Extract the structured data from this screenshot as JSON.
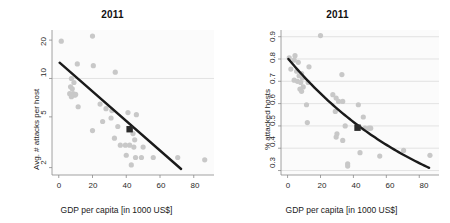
{
  "figure": {
    "width": 450,
    "height": 223,
    "background": "#ffffff",
    "point_color": "#c8c8c8",
    "fit_line_color": "#1a1a1a",
    "highlight_marker_color": "#2b2b2b",
    "grid_color": "#d9d9d9",
    "axis_color": "#8a8a8a"
  },
  "chart_data": [
    {
      "id": "left-panel",
      "type": "scatter",
      "title": "2011",
      "xlabel": "GDP per capita [in 1000 US$]",
      "ylabel": "Avg. # attacks per host",
      "xlim": [
        -4,
        92
      ],
      "ylim": [
        1.75,
        24
      ],
      "yscale": "log",
      "xticks": [
        0,
        20,
        40,
        60,
        80
      ],
      "xticklabels": [
        "0",
        "20",
        "40",
        "60",
        "80"
      ],
      "yticks": [
        2,
        5,
        10,
        20
      ],
      "yticklabels": [
        "2",
        "5",
        "10",
        "20"
      ],
      "grid": "horizontal gridline at y=10 only",
      "legend": "none",
      "points": [
        [
          1.5,
          19.6
        ],
        [
          20.0,
          21.5
        ],
        [
          11.0,
          13.0
        ],
        [
          20.5,
          12.6
        ],
        [
          33.5,
          11.2
        ],
        [
          7.5,
          10.0
        ],
        [
          9.0,
          9.3
        ],
        [
          7.0,
          8.6
        ],
        [
          8.0,
          8.3
        ],
        [
          6.5,
          7.6
        ],
        [
          8.5,
          7.6
        ],
        [
          10.0,
          7.5
        ],
        [
          9.5,
          7.4
        ],
        [
          7.5,
          7.2
        ],
        [
          11.5,
          6.0
        ],
        [
          24.5,
          6.3
        ],
        [
          28.0,
          5.8
        ],
        [
          31.5,
          5.6
        ],
        [
          41.0,
          5.4
        ],
        [
          46.0,
          5.2
        ],
        [
          26.0,
          4.6
        ],
        [
          31.0,
          4.9
        ],
        [
          20.0,
          3.9
        ],
        [
          35.0,
          4.2
        ],
        [
          42.5,
          4.0
        ],
        [
          44.0,
          3.7
        ],
        [
          45.0,
          3.3
        ],
        [
          33.0,
          3.4
        ],
        [
          36.5,
          3.0
        ],
        [
          39.5,
          3.0
        ],
        [
          42.0,
          3.0
        ],
        [
          44.5,
          2.9
        ],
        [
          50.0,
          2.9
        ],
        [
          40.0,
          2.5
        ],
        [
          45.5,
          2.4
        ],
        [
          49.0,
          2.4
        ],
        [
          56.0,
          2.4
        ],
        [
          70.5,
          2.4
        ],
        [
          86.5,
          2.3
        ],
        [
          43.0,
          2.1
        ]
      ],
      "fit_line": {
        "type": "log-linear trend",
        "x_start": 0.5,
        "y_start": 13.3,
        "x_end": 72.5,
        "y_end": 1.95
      },
      "highlight_marker": {
        "x": 42.0,
        "y": 4.0,
        "shape": "square"
      }
    },
    {
      "id": "right-panel",
      "type": "scatter",
      "title": "2011",
      "xlabel": "GDP per capita [in 1000 US$]",
      "ylabel": "% attacked hosts",
      "xlim": [
        -4,
        92
      ],
      "ylim": [
        0.28,
        0.93
      ],
      "yscale": "linear",
      "xticks": [
        0,
        20,
        40,
        60,
        80
      ],
      "xticklabels": [
        "0",
        "20",
        "40",
        "60",
        "80"
      ],
      "yticks": [
        0.3,
        0.4,
        0.5,
        0.6,
        0.7,
        0.8,
        0.9
      ],
      "yticklabels": [
        "0.3",
        "0.4",
        "0.5",
        "0.6",
        "0.7",
        "0.8",
        "0.9"
      ],
      "grid": "horizontal gridlines at every y tick",
      "legend": "none",
      "points": [
        [
          20.0,
          0.905
        ],
        [
          1.0,
          0.805
        ],
        [
          4.5,
          0.815
        ],
        [
          4.0,
          0.795
        ],
        [
          6.5,
          0.785
        ],
        [
          13.0,
          0.765
        ],
        [
          2.0,
          0.755
        ],
        [
          5.5,
          0.745
        ],
        [
          8.5,
          0.735
        ],
        [
          7.0,
          0.725
        ],
        [
          9.0,
          0.715
        ],
        [
          4.0,
          0.705
        ],
        [
          6.0,
          0.7
        ],
        [
          8.0,
          0.695
        ],
        [
          12.5,
          0.695
        ],
        [
          33.0,
          0.73
        ],
        [
          9.5,
          0.675
        ],
        [
          7.5,
          0.665
        ],
        [
          8.5,
          0.655
        ],
        [
          27.5,
          0.64
        ],
        [
          29.5,
          0.625
        ],
        [
          31.0,
          0.61
        ],
        [
          33.5,
          0.61
        ],
        [
          11.5,
          0.595
        ],
        [
          43.0,
          0.595
        ],
        [
          29.0,
          0.565
        ],
        [
          46.0,
          0.54
        ],
        [
          12.0,
          0.515
        ],
        [
          35.0,
          0.5
        ],
        [
          43.5,
          0.495
        ],
        [
          47.0,
          0.49
        ],
        [
          49.5,
          0.49
        ],
        [
          50.5,
          0.49
        ],
        [
          29.5,
          0.45
        ],
        [
          33.5,
          0.435
        ],
        [
          30.0,
          0.465
        ],
        [
          44.0,
          0.38
        ],
        [
          70.5,
          0.39
        ],
        [
          56.0,
          0.365
        ],
        [
          86.5,
          0.368
        ],
        [
          36.5,
          0.33
        ],
        [
          36.5,
          0.32
        ]
      ],
      "fit_line": {
        "type": "decaying curve",
        "x_start": 0.5,
        "y_start": 0.8,
        "x_end": 86.0,
        "y_end": 0.312
      },
      "highlight_marker": {
        "x": 42.5,
        "y": 0.492,
        "shape": "square"
      }
    }
  ]
}
